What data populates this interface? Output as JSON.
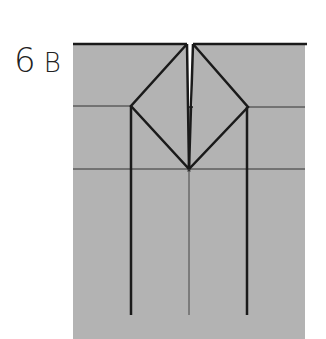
{
  "figure": {
    "label_number": "6",
    "label_letter": "B"
  },
  "colors": {
    "paper": "#b3b3b3",
    "line": "#1a1a1a",
    "background": "#ffffff"
  }
}
